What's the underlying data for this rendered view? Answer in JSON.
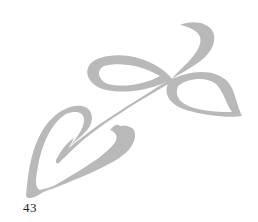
{
  "page": {
    "page_number": "43",
    "ornament": {
      "icon": "leaf-sprig-ornament-icon",
      "color": "#b8b8b8"
    }
  }
}
